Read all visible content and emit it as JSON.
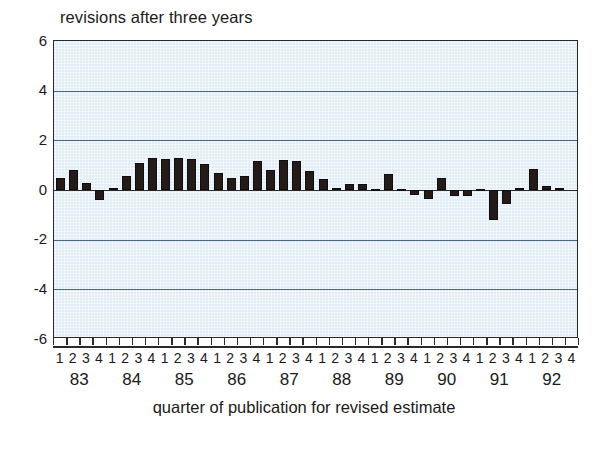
{
  "chart_data": {
    "type": "bar",
    "title": "revisions after three years",
    "xlabel": "quarter of publication for revised estimate",
    "ylabel": "",
    "ylim": [
      -6,
      6
    ],
    "yticks": [
      6,
      4,
      2,
      0,
      -2,
      -4,
      -6
    ],
    "grid": true,
    "legend": null,
    "years": [
      "83",
      "84",
      "85",
      "86",
      "87",
      "88",
      "89",
      "90",
      "91",
      "92"
    ],
    "quarters": [
      "1",
      "2",
      "3",
      "4"
    ],
    "categories": [
      "83Q1",
      "83Q2",
      "83Q3",
      "83Q4",
      "84Q1",
      "84Q2",
      "84Q3",
      "84Q4",
      "85Q1",
      "85Q2",
      "85Q3",
      "85Q4",
      "86Q1",
      "86Q2",
      "86Q3",
      "86Q4",
      "87Q1",
      "87Q2",
      "87Q3",
      "87Q4",
      "88Q1",
      "88Q2",
      "88Q3",
      "88Q4",
      "89Q1",
      "89Q2",
      "89Q3",
      "89Q4",
      "90Q1",
      "90Q2",
      "90Q3",
      "90Q4",
      "91Q1",
      "91Q2",
      "91Q3",
      "91Q4",
      "92Q1",
      "92Q2",
      "92Q3",
      "92Q4"
    ],
    "values": [
      0.5,
      0.8,
      0.3,
      -0.4,
      0.1,
      0.55,
      1.1,
      1.3,
      1.25,
      1.3,
      1.25,
      1.05,
      0.7,
      0.5,
      0.55,
      1.15,
      0.8,
      1.2,
      1.15,
      0.75,
      0.45,
      0.1,
      0.25,
      0.25,
      0.05,
      0.65,
      0.05,
      -0.2,
      -0.35,
      0.5,
      -0.25,
      -0.25,
      0.05,
      -1.2,
      -0.55,
      0.1,
      0.85,
      0.15,
      0.1,
      0.0
    ]
  },
  "colors": {
    "bar": "#241a18",
    "plot_background": "#eaf3fa",
    "gridline": "#4a6780",
    "axis": "#2b2b2b",
    "text": "#1a1a1a"
  }
}
